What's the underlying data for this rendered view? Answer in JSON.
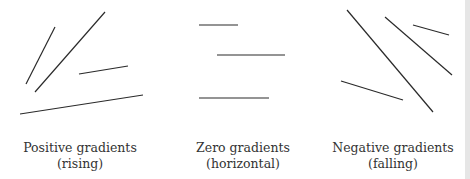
{
  "diagram": {
    "line_color": "#2a2a2a",
    "groups": [
      {
        "caption_line1": "Positive gradients",
        "caption_line2": "(rising)",
        "lines": [
          {
            "x1": 55,
            "y1": 27,
            "x2": 26,
            "y2": 84
          },
          {
            "x1": 105,
            "y1": 12,
            "x2": 35,
            "y2": 92
          },
          {
            "x1": 79,
            "y1": 74,
            "x2": 128,
            "y2": 66
          },
          {
            "x1": 20,
            "y1": 114,
            "x2": 143,
            "y2": 95
          }
        ]
      },
      {
        "caption_line1": "Zero gradients",
        "caption_line2": "(horizontal)",
        "lines": [
          {
            "x1": 199,
            "y1": 25,
            "x2": 238,
            "y2": 25
          },
          {
            "x1": 217,
            "y1": 55,
            "x2": 285,
            "y2": 55
          },
          {
            "x1": 199,
            "y1": 98,
            "x2": 269,
            "y2": 98
          }
        ]
      },
      {
        "caption_line1": "Negative gradients",
        "caption_line2": "(falling)",
        "lines": [
          {
            "x1": 347,
            "y1": 10,
            "x2": 433,
            "y2": 112
          },
          {
            "x1": 385,
            "y1": 17,
            "x2": 452,
            "y2": 75
          },
          {
            "x1": 413,
            "y1": 25,
            "x2": 449,
            "y2": 35
          },
          {
            "x1": 341,
            "y1": 81,
            "x2": 403,
            "y2": 100
          }
        ]
      }
    ]
  }
}
